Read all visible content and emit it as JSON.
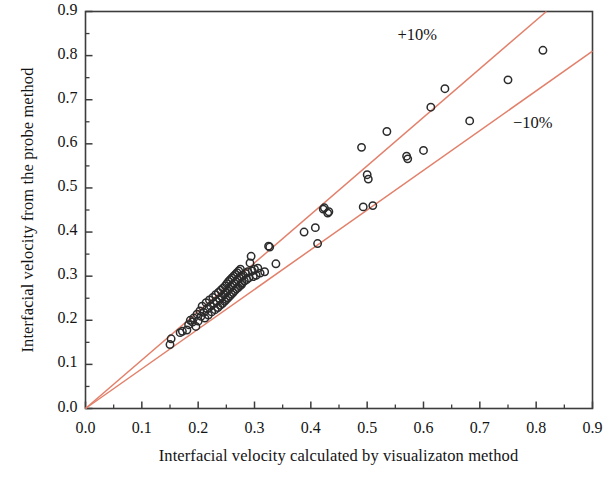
{
  "chart_data": {
    "type": "scatter",
    "title": "",
    "xlabel": "Interfacial velocity calculated by visualizaton method",
    "ylabel": "Interfacial velocity from the probe method",
    "xlim": [
      0.0,
      0.9
    ],
    "ylim": [
      0.0,
      0.9
    ],
    "xticks": [
      "0.0",
      "0.1",
      "0.2",
      "0.3",
      "0.4",
      "0.5",
      "0.6",
      "0.7",
      "0.8",
      "0.9"
    ],
    "yticks": [
      "0.0",
      "0.1",
      "0.2",
      "0.3",
      "0.4",
      "0.5",
      "0.6",
      "0.7",
      "0.8",
      "0.9"
    ],
    "xtick_values": [
      0.0,
      0.1,
      0.2,
      0.3,
      0.4,
      0.5,
      0.6,
      0.7,
      0.8,
      0.9
    ],
    "ytick_values": [
      0.0,
      0.1,
      0.2,
      0.3,
      0.4,
      0.5,
      0.6,
      0.7,
      0.8,
      0.9
    ],
    "minor_ticks": true,
    "grid": false,
    "legend": "none",
    "marker": {
      "shape": "circle-open",
      "edge_color": "#2b2b2b",
      "fill": "none",
      "size_px": 7.4,
      "edge_width_px": 1.5
    },
    "reference_lines": [
      {
        "name": "+10%",
        "slope": 1.1,
        "intercept": 0.0,
        "color": "#e2806b",
        "label": "+10%"
      },
      {
        "name": "-10%",
        "slope": 0.9,
        "intercept": 0.0,
        "color": "#e2806b",
        "label": "−10%"
      }
    ],
    "annotations": [
      {
        "text": "+10%",
        "x": 0.6,
        "y": 0.845
      },
      {
        "text": "−10%",
        "x": 0.805,
        "y": 0.645
      }
    ],
    "points": [
      [
        0.15,
        0.145
      ],
      [
        0.152,
        0.158
      ],
      [
        0.168,
        0.172
      ],
      [
        0.172,
        0.175
      ],
      [
        0.18,
        0.178
      ],
      [
        0.183,
        0.19
      ],
      [
        0.186,
        0.2
      ],
      [
        0.19,
        0.196
      ],
      [
        0.192,
        0.205
      ],
      [
        0.196,
        0.186
      ],
      [
        0.198,
        0.214
      ],
      [
        0.2,
        0.198
      ],
      [
        0.203,
        0.221
      ],
      [
        0.205,
        0.209
      ],
      [
        0.207,
        0.232
      ],
      [
        0.21,
        0.218
      ],
      [
        0.212,
        0.205
      ],
      [
        0.214,
        0.24
      ],
      [
        0.216,
        0.226
      ],
      [
        0.218,
        0.212
      ],
      [
        0.22,
        0.246
      ],
      [
        0.222,
        0.232
      ],
      [
        0.224,
        0.219
      ],
      [
        0.226,
        0.252
      ],
      [
        0.228,
        0.238
      ],
      [
        0.23,
        0.224
      ],
      [
        0.231,
        0.258
      ],
      [
        0.233,
        0.243
      ],
      [
        0.235,
        0.229
      ],
      [
        0.236,
        0.263
      ],
      [
        0.238,
        0.248
      ],
      [
        0.239,
        0.234
      ],
      [
        0.24,
        0.268
      ],
      [
        0.242,
        0.253
      ],
      [
        0.243,
        0.238
      ],
      [
        0.244,
        0.273
      ],
      [
        0.246,
        0.258
      ],
      [
        0.247,
        0.243
      ],
      [
        0.248,
        0.278
      ],
      [
        0.249,
        0.262
      ],
      [
        0.25,
        0.247
      ],
      [
        0.251,
        0.283
      ],
      [
        0.252,
        0.267
      ],
      [
        0.253,
        0.251
      ],
      [
        0.254,
        0.288
      ],
      [
        0.255,
        0.271
      ],
      [
        0.256,
        0.255
      ],
      [
        0.257,
        0.292
      ],
      [
        0.258,
        0.276
      ],
      [
        0.259,
        0.259
      ],
      [
        0.26,
        0.296
      ],
      [
        0.261,
        0.28
      ],
      [
        0.262,
        0.263
      ],
      [
        0.263,
        0.3
      ],
      [
        0.264,
        0.284
      ],
      [
        0.265,
        0.267
      ],
      [
        0.266,
        0.304
      ],
      [
        0.267,
        0.288
      ],
      [
        0.268,
        0.271
      ],
      [
        0.269,
        0.308
      ],
      [
        0.27,
        0.292
      ],
      [
        0.271,
        0.274
      ],
      [
        0.272,
        0.312
      ],
      [
        0.273,
        0.296
      ],
      [
        0.274,
        0.278
      ],
      [
        0.275,
        0.316
      ],
      [
        0.276,
        0.299
      ],
      [
        0.277,
        0.281
      ],
      [
        0.278,
        0.285
      ],
      [
        0.28,
        0.302
      ],
      [
        0.282,
        0.289
      ],
      [
        0.284,
        0.306
      ],
      [
        0.286,
        0.292
      ],
      [
        0.288,
        0.31
      ],
      [
        0.29,
        0.296
      ],
      [
        0.292,
        0.33
      ],
      [
        0.294,
        0.345
      ],
      [
        0.296,
        0.312
      ],
      [
        0.298,
        0.299
      ],
      [
        0.3,
        0.316
      ],
      [
        0.303,
        0.302
      ],
      [
        0.306,
        0.318
      ],
      [
        0.31,
        0.307
      ],
      [
        0.318,
        0.31
      ],
      [
        0.325,
        0.368
      ],
      [
        0.327,
        0.366
      ],
      [
        0.338,
        0.328
      ],
      [
        0.388,
        0.4
      ],
      [
        0.408,
        0.41
      ],
      [
        0.412,
        0.374
      ],
      [
        0.422,
        0.452
      ],
      [
        0.424,
        0.455
      ],
      [
        0.43,
        0.443
      ],
      [
        0.432,
        0.446
      ],
      [
        0.49,
        0.592
      ],
      [
        0.493,
        0.457
      ],
      [
        0.5,
        0.53
      ],
      [
        0.502,
        0.52
      ],
      [
        0.51,
        0.46
      ],
      [
        0.535,
        0.628
      ],
      [
        0.57,
        0.572
      ],
      [
        0.572,
        0.566
      ],
      [
        0.6,
        0.585
      ],
      [
        0.613,
        0.683
      ],
      [
        0.638,
        0.725
      ],
      [
        0.682,
        0.652
      ],
      [
        0.75,
        0.745
      ],
      [
        0.812,
        0.812
      ]
    ]
  },
  "axes": {
    "frame_color": "#3d3d3d",
    "tick_color": "#3d3d3d"
  }
}
